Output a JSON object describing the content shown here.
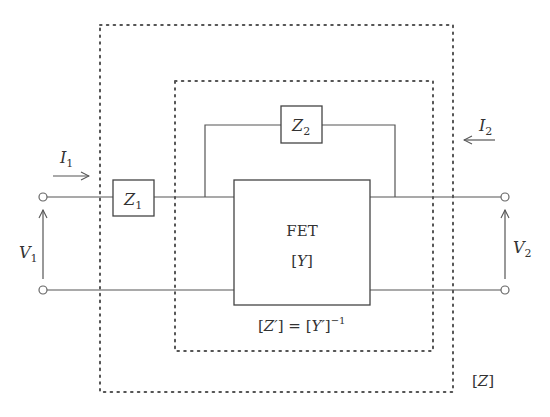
{
  "diagram": {
    "colors": {
      "line": "#555555",
      "text": "#333333",
      "background": "#ffffff"
    },
    "elements": {
      "z1": {
        "label": "Z",
        "subscript": "1"
      },
      "z2": {
        "label": "Z",
        "subscript": "2"
      },
      "fet": {
        "label": "FET",
        "matrix": "[Y]"
      },
      "inner_matrix": {
        "left": "[Z′] = [Y′]",
        "exponent": "−1"
      },
      "outer_matrix": {
        "label": "[Z]"
      },
      "i1": {
        "label": "I",
        "subscript": "1"
      },
      "i2": {
        "label": "I",
        "subscript": "2"
      },
      "v1": {
        "label": "V",
        "subscript": "1"
      },
      "v2": {
        "label": "V",
        "subscript": "2"
      }
    }
  }
}
